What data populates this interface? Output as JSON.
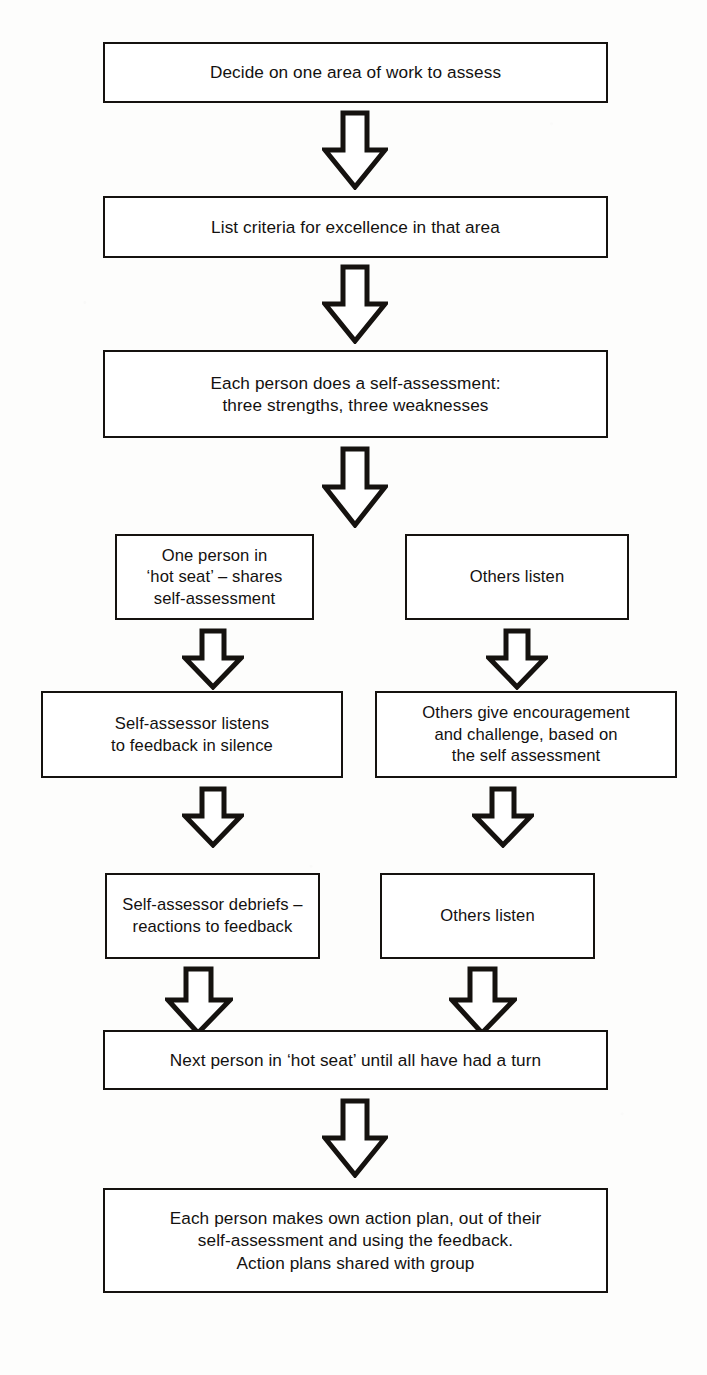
{
  "diagram": {
    "type": "flowchart",
    "orientation": "top-to-bottom",
    "line_color": "#15120f",
    "fill_color": "#ffffff",
    "page_background": "#fdfdfc"
  },
  "nodes": [
    {
      "id": "decide-area",
      "label": "Decide on one area of work to assess",
      "column": "full",
      "step": 1
    },
    {
      "id": "list-criteria",
      "label": "List criteria for excellence in that area",
      "column": "full",
      "step": 2
    },
    {
      "id": "self-assessment",
      "label": "Each person does a self-assessment:\nthree strengths, three weaknesses",
      "column": "full",
      "step": 3
    },
    {
      "id": "hot-seat-shares",
      "label": "One person in\n‘hot seat’ – shares\nself-assessment",
      "column": "left",
      "step": 4
    },
    {
      "id": "others-listen-1",
      "label": "Others listen",
      "column": "right",
      "step": 4
    },
    {
      "id": "listens-in-silence",
      "label": "Self-assessor listens\nto feedback in silence",
      "column": "left",
      "step": 5
    },
    {
      "id": "others-give-encouragement",
      "label": "Others give encouragement\nand challenge, based on\nthe self assessment",
      "column": "right",
      "step": 5
    },
    {
      "id": "debriefs-reactions",
      "label": "Self-assessor debriefs –\nreactions to feedback",
      "column": "left",
      "step": 6
    },
    {
      "id": "others-listen-2",
      "label": "Others listen",
      "column": "right",
      "step": 6
    },
    {
      "id": "next-person",
      "label": "Next person in ‘hot seat’ until all have had a turn",
      "column": "full",
      "step": 7
    },
    {
      "id": "action-plan",
      "label": "Each person makes own action plan, out of their\nself-assessment and using the feedback.\nAction plans shared with group",
      "column": "full",
      "step": 8
    }
  ],
  "connectors": [
    {
      "id": "arrow-1",
      "from": "decide-area",
      "to": "list-criteria",
      "direction": "down"
    },
    {
      "id": "arrow-2",
      "from": "list-criteria",
      "to": "self-assessment",
      "direction": "down"
    },
    {
      "id": "arrow-3",
      "from": "self-assessment",
      "to": "hot-seat-shares",
      "direction": "down"
    },
    {
      "id": "arrow-4",
      "from": "hot-seat-shares",
      "to": "listens-in-silence",
      "direction": "down"
    },
    {
      "id": "arrow-5",
      "from": "others-listen-1",
      "to": "others-give-encouragement",
      "direction": "down"
    },
    {
      "id": "arrow-6",
      "from": "listens-in-silence",
      "to": "debriefs-reactions",
      "direction": "down"
    },
    {
      "id": "arrow-7",
      "from": "others-give-encouragement",
      "to": "others-listen-2",
      "direction": "down"
    },
    {
      "id": "arrow-8",
      "from": "debriefs-reactions",
      "to": "next-person",
      "direction": "down"
    },
    {
      "id": "arrow-9",
      "from": "others-listen-2",
      "to": "next-person",
      "direction": "down"
    },
    {
      "id": "arrow-10",
      "from": "next-person",
      "to": "action-plan",
      "direction": "down"
    }
  ]
}
